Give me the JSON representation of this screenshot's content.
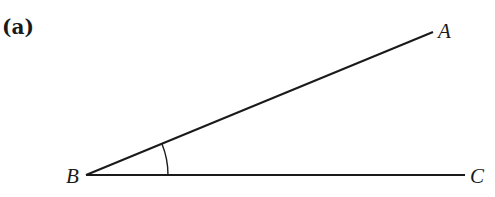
{
  "figure": {
    "part_label": "(a)",
    "points": {
      "A": {
        "label": "A",
        "x": 433,
        "y": 32
      },
      "B": {
        "label": "B",
        "x": 86,
        "y": 175
      },
      "C": {
        "label": "C",
        "x": 465,
        "y": 175
      }
    },
    "segments": [
      {
        "from": "B",
        "to": "A"
      },
      {
        "from": "B",
        "to": "C"
      }
    ],
    "angle_marker": {
      "vertex": "B",
      "between": [
        "A",
        "C"
      ],
      "radius": 82
    },
    "colors": {
      "line": "#1a1a1a",
      "background": "#ffffff"
    }
  }
}
